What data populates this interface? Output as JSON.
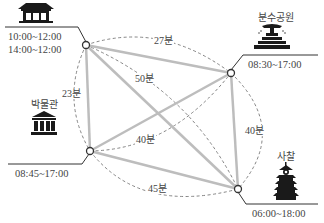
{
  "diagram": {
    "title": "",
    "nodes": [
      {
        "id": "palace",
        "name": "",
        "icon": "palace-icon",
        "hours": [
          "10:00~12:00",
          "14:00~12:00"
        ]
      },
      {
        "id": "fountain_park",
        "name": "분수공원",
        "icon": "fountain-icon",
        "hours": [
          "08:30~17:00"
        ]
      },
      {
        "id": "museum",
        "name": "박물관",
        "icon": "museum-icon",
        "hours": [
          "08:45~17:00"
        ]
      },
      {
        "id": "temple",
        "name": "사찰",
        "icon": "pagoda-icon",
        "hours": [
          "06:00~18:00"
        ]
      }
    ],
    "edges": [
      {
        "from": "palace",
        "to": "fountain_park",
        "label": "27분"
      },
      {
        "from": "palace",
        "to": "temple",
        "label": "50분"
      },
      {
        "from": "palace",
        "to": "museum",
        "label": "23분"
      },
      {
        "from": "museum",
        "to": "fountain_park",
        "label": "40분"
      },
      {
        "from": "fountain_park",
        "to": "temple",
        "label": "40분"
      },
      {
        "from": "museum",
        "to": "temple",
        "label": "45분"
      }
    ],
    "colors": {
      "edge": "#bdbdbd",
      "dashed": "#777777",
      "node": "#333333",
      "icon": "#1a1a1a"
    }
  }
}
